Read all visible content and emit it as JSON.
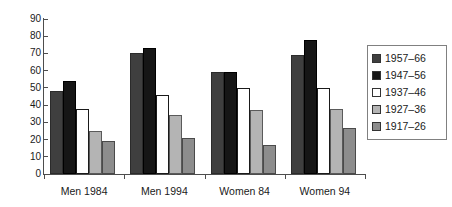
{
  "chart_data": {
    "type": "bar",
    "title": "",
    "subtitle": "",
    "xlabel": "",
    "ylabel": "",
    "ylim": [
      0,
      90
    ],
    "ytick_step": 10,
    "yticks": [
      "90",
      "80",
      "70",
      "60",
      "50",
      "40",
      "30",
      "20",
      "10",
      "0"
    ],
    "grid": false,
    "legend_position": "right",
    "categories": [
      "Men 1984",
      "Men 1994",
      "Women 84",
      "Women 94"
    ],
    "series": [
      {
        "name": "1957–66",
        "color": "#3f3f3f",
        "values": [
          48,
          70,
          59,
          69
        ]
      },
      {
        "name": "1947–56",
        "color": "#161616",
        "values": [
          54,
          73,
          59,
          78
        ]
      },
      {
        "name": "1937–46",
        "color": "#ffffff",
        "values": [
          38,
          46,
          50,
          50
        ]
      },
      {
        "name": "1927–36",
        "color": "#b4b4b4",
        "values": [
          25,
          34,
          37,
          38
        ]
      },
      {
        "name": "1917–26",
        "color": "#8d8d8d",
        "values": [
          19,
          21,
          17,
          27
        ]
      }
    ]
  },
  "legend": {
    "items": [
      {
        "label": "1957–66"
      },
      {
        "label": "1947–56"
      },
      {
        "label": "1937–46"
      },
      {
        "label": "1927–36"
      },
      {
        "label": "1917–26"
      }
    ]
  }
}
